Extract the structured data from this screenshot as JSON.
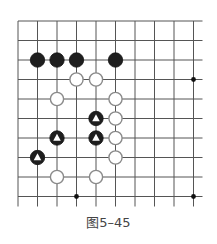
{
  "figure": {
    "caption": "图5–45",
    "type": "go-board-diagram"
  },
  "board": {
    "origin_x": 18,
    "origin_y": 21,
    "spacing": 19.5,
    "cols": 10,
    "rows": 10,
    "line_extend_right": 9,
    "line_extend_bottom": 10,
    "line_color": "#555555",
    "star_points": [
      [
        9,
        3
      ],
      [
        3,
        9
      ],
      [
        9,
        9
      ]
    ],
    "stones": [
      {
        "color": "black",
        "col": 1,
        "row": 2,
        "mark": ""
      },
      {
        "color": "black",
        "col": 2,
        "row": 2,
        "mark": ""
      },
      {
        "color": "black",
        "col": 3,
        "row": 2,
        "mark": ""
      },
      {
        "color": "black",
        "col": 5,
        "row": 2,
        "mark": ""
      },
      {
        "color": "white",
        "col": 3,
        "row": 3,
        "mark": ""
      },
      {
        "color": "white",
        "col": 4,
        "row": 3,
        "mark": ""
      },
      {
        "color": "white",
        "col": 2,
        "row": 4,
        "mark": ""
      },
      {
        "color": "white",
        "col": 5,
        "row": 4,
        "mark": ""
      },
      {
        "color": "black",
        "col": 4,
        "row": 5,
        "mark": "triangle"
      },
      {
        "color": "white",
        "col": 5,
        "row": 5,
        "mark": ""
      },
      {
        "color": "black",
        "col": 2,
        "row": 6,
        "mark": "triangle"
      },
      {
        "color": "black",
        "col": 4,
        "row": 6,
        "mark": "triangle"
      },
      {
        "color": "white",
        "col": 5,
        "row": 6,
        "mark": ""
      },
      {
        "color": "black",
        "col": 1,
        "row": 7,
        "mark": "triangle"
      },
      {
        "color": "white",
        "col": 5,
        "row": 7,
        "mark": ""
      },
      {
        "color": "white",
        "col": 2,
        "row": 8,
        "mark": ""
      },
      {
        "color": "white",
        "col": 4,
        "row": 8,
        "mark": ""
      }
    ]
  }
}
